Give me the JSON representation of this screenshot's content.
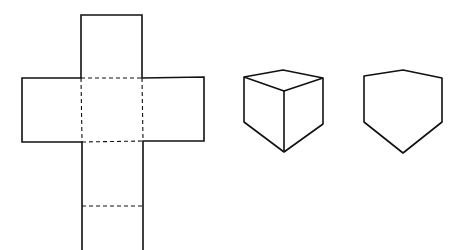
{
  "diagram": {
    "stroke_color": "#111111",
    "background": "#ffffff",
    "figures": [
      {
        "name": "cube-net",
        "description": "Cross-shaped net of a cube with dashed fold lines"
      },
      {
        "name": "cube-3d",
        "description": "Isometric cube drawing"
      },
      {
        "name": "cube-outline",
        "description": "Hexagonal silhouette of cube"
      }
    ]
  }
}
